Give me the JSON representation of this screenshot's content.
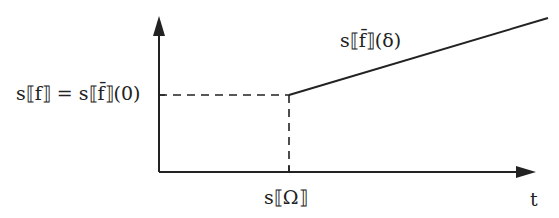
{
  "diagram": {
    "y_label_left": "s⟦f⟧ = s⟦f̄⟧(0)",
    "line_label": "s⟦f̄⟧(δ)",
    "x_tick_label": "s⟦Ω⟧",
    "x_axis_label": "t",
    "colors": {
      "stroke": "#222222",
      "background": "#ffffff"
    }
  }
}
